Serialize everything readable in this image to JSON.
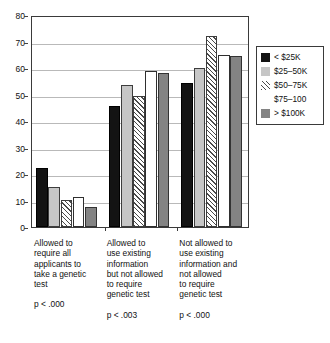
{
  "chart_data": {
    "type": "bar",
    "title": "",
    "subtitle": "",
    "xlabel": "",
    "ylabel": "",
    "ylim": [
      0,
      80
    ],
    "yticks": [
      0,
      10,
      20,
      30,
      40,
      50,
      60,
      70,
      80
    ],
    "grid": true,
    "legend_position": "right",
    "categories": [
      "Allowed to\nrequire all\napplicants to\ntake a genetic\ntest",
      "Allowed to\nuse existing\ninformation\nbut not allowed\nto require\ngenetic test",
      "Not allowed to\nuse existing\ninformation and\nnot allowed\nto require\ngenetic test"
    ],
    "annotations": [
      "p < .000",
      "p < .003",
      "p < .000"
    ],
    "series": [
      {
        "name": "< $25K",
        "values": [
          22.3,
          45.5,
          54.2
        ],
        "swatch": "sw-black"
      },
      {
        "name": "$25–50K",
        "values": [
          15.0,
          53.6,
          60.1
        ],
        "swatch": "sw-lgray"
      },
      {
        "name": "$50–75K",
        "values": [
          10.3,
          49.5,
          72.2
        ],
        "swatch": "sw-hatch"
      },
      {
        "name": "$75–100",
        "values": [
          11.3,
          58.9,
          65.0
        ],
        "swatch": "sw-white"
      },
      {
        "name": "> $100K",
        "values": [
          7.5,
          58.1,
          64.4
        ],
        "swatch": "sw-dgray"
      }
    ],
    "colors": {
      "series_1": "#131313",
      "series_2": "#c6c6c6",
      "series_3": "#ffffff",
      "series_4": "#ffffff",
      "series_5": "#838383",
      "axis": "#3a3a3a",
      "gridline": "#b9b9b9",
      "text": "#111111"
    }
  }
}
